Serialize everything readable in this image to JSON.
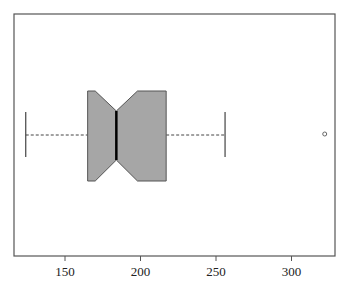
{
  "chart_data": {
    "type": "boxplot",
    "orientation": "horizontal",
    "notched": true,
    "title": "",
    "xlabel": "",
    "ylabel": "",
    "xlim": [
      117,
      335
    ],
    "x_ticks": [
      150,
      200,
      250,
      300
    ],
    "x_tick_labels": [
      "150",
      "200",
      "250",
      "300"
    ],
    "grid": false,
    "series": [
      {
        "name": "",
        "whisker_low": 124,
        "q1": 165,
        "notch_low": 170,
        "median": 184,
        "notch_high": 198,
        "q3": 217,
        "whisker_high": 256,
        "outliers": [
          322
        ]
      }
    ],
    "colors": {
      "box_fill": "#a6a6a6",
      "box_stroke": "#555555",
      "median": "#000000",
      "whisker": "#444444",
      "frame": "#555555"
    }
  },
  "axis": {
    "tick_labels": [
      "150",
      "200",
      "250",
      "300"
    ]
  }
}
